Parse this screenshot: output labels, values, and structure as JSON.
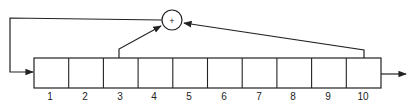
{
  "diagram": {
    "type": "linear-feedback-shift-register",
    "cells": [
      "1",
      "2",
      "3",
      "4",
      "5",
      "6",
      "7",
      "8",
      "9",
      "10"
    ],
    "xor_symbol": "+",
    "taps": [
      "3",
      "10"
    ],
    "colors": {
      "stroke": "#222222",
      "background": "#ffffff"
    }
  }
}
